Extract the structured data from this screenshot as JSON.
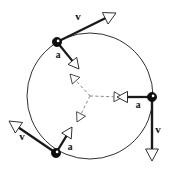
{
  "figure": {
    "background_color": "#ffffff",
    "stroke_color": "#1a1a1a",
    "dashed_color": "#8a8a8a",
    "circle": {
      "center_x": 90,
      "center_y": 96,
      "radius": 63,
      "stroke_width": 0.9
    },
    "labels": {
      "velocity": "v",
      "acceleration": "a"
    },
    "particles": [
      {
        "id": "particle-top-left",
        "x": 57,
        "y": 42,
        "angle_deg": 150,
        "radius_px": 4.6,
        "velocity": {
          "label": "v",
          "tip_x": 116,
          "tip_y": 13,
          "label_x": 78,
          "label_y": 20
        },
        "acceleration": {
          "label": "a",
          "tip_x": 79,
          "tip_y": 69,
          "label_x": 58,
          "label_y": 58
        },
        "radius_line": {
          "tip_x": 70,
          "tip_y": 74
        }
      },
      {
        "id": "particle-right",
        "x": 152,
        "y": 97,
        "angle_deg": 0,
        "radius_px": 4.6,
        "velocity": {
          "label": "v",
          "tip_x": 152,
          "tip_y": 161,
          "label_x": 158,
          "label_y": 133
        },
        "acceleration": {
          "label": "a",
          "tip_x": 117,
          "tip_y": 97,
          "label_x": 138,
          "label_y": 108
        },
        "radius_line": {
          "tip_x": 123,
          "tip_y": 97
        }
      },
      {
        "id": "particle-bottom-left",
        "x": 56,
        "y": 153,
        "angle_deg": 240,
        "radius_px": 4.6,
        "velocity": {
          "label": "v",
          "tip_x": 9,
          "tip_y": 121,
          "label_x": 22,
          "label_y": 140
        },
        "acceleration": {
          "label": "a",
          "tip_x": 72,
          "tip_y": 127,
          "label_x": 70,
          "label_y": 150
        },
        "radius_line": {
          "tip_x": 77,
          "tip_y": 122
        }
      }
    ]
  }
}
